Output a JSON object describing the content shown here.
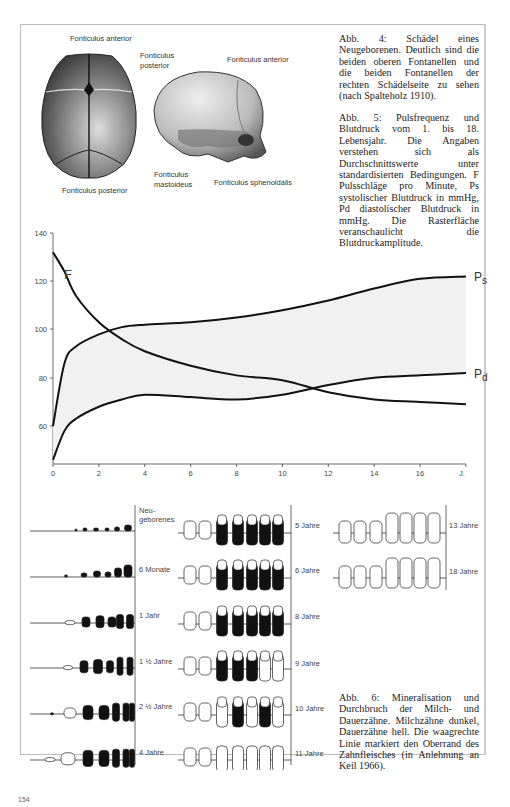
{
  "figure4": {
    "labels": {
      "top_anterior": "Fonticulus anterior",
      "top_posterior": "Fonticulus posterior",
      "side_posterior_line1": "Fonticulus",
      "side_posterior_line2": "posterior",
      "side_anterior": "Fonticulus anterior",
      "side_mastoideus_line1": "Fonticulus",
      "side_mastoideus_line2": "mastoideus",
      "side_sphenoidalis": "Fonticulus sphenoidalis"
    },
    "caption": "Abb. 4: Schädel eines Neugeborenen. Deutlich sind die beiden oberen Fontanellen und die beiden Fontanellen der rechten Schädelseite zu sehen (nach Spalteholz 1910)."
  },
  "figure5": {
    "caption": "Abb. 5: Pulsfrequenz und Blutdruck vom 1. bis 18. Lebensjahr. Die Angaben verstehen sich als Durchschnittswerte unter standardisierten Bedingungen. F Pulsschläge pro Minute, Ps systolischer Blutdruck in mmHg, Pd diastolischer Blutdruck in mmHg. Die Rasterfläche veranschaulicht die Blutdruckamplitude.",
    "series_labels": {
      "F": "F",
      "Ps_main": "P",
      "Ps_sub": "s",
      "Pd_main": "P",
      "Pd_sub": "d"
    },
    "x_unit_label": "J."
  },
  "chart_data": {
    "type": "line",
    "title": "Pulsfrequenz und Blutdruck vom 1. bis 18. Lebensjahr",
    "xlabel": "J.",
    "ylabel": "",
    "xlim": [
      0,
      18
    ],
    "ylim": [
      45,
      140
    ],
    "x_ticks": [
      0,
      2,
      4,
      6,
      8,
      10,
      12,
      14,
      16
    ],
    "y_ticks": [
      60,
      80,
      100,
      120,
      140
    ],
    "grid": false,
    "legend": "inline labels at line ends",
    "x": [
      0,
      0.5,
      1,
      2,
      3,
      4,
      6,
      8,
      10,
      12,
      14,
      16,
      18
    ],
    "series": [
      {
        "name": "F",
        "description": "Pulsschläge pro Minute",
        "values": [
          132,
          124,
          114,
          103,
          96,
          91,
          85,
          81,
          79,
          74,
          71,
          70,
          69
        ]
      },
      {
        "name": "Ps",
        "description": "systolischer Blutdruck (mmHg)",
        "values": [
          60,
          86,
          93,
          98,
          101,
          102,
          103,
          105,
          108,
          112,
          117,
          121,
          122
        ]
      },
      {
        "name": "Pd",
        "description": "diastolischer Blutdruck (mmHg)",
        "values": [
          46,
          58,
          63,
          68,
          71,
          73,
          72,
          71,
          73,
          77,
          80,
          81,
          82
        ]
      }
    ],
    "shaded_area": "between Ps and Pd (Blutdruckamplitude)"
  },
  "figure6": {
    "caption": "Abb. 6: Mineralisation und Durchbruch der Milch- und Dauerzähne. Milchzähne dunkel, Dauerzähne hell. Die waagrechte Linie markiert den Oberrand des Zahnfleisches (in Anlehnung an Keil 1966).",
    "stages_col1": [
      "Neugeborenes",
      "6 Monate",
      "1 Jahr",
      "1 ½ Jahre",
      "2 ½ Jahre",
      "4 Jahre"
    ],
    "stages_col2": [
      "5 Jahre",
      "6 Jahre",
      "8 Jahre",
      "9 Jahre",
      "10 Jahre",
      "11 Jahre"
    ],
    "stages_col3": [
      "13 Jahre",
      "18 Jahre"
    ],
    "neugeborenes_line1": "Neu-",
    "neugeborenes_line2": "geborenes"
  },
  "page_number": "154"
}
